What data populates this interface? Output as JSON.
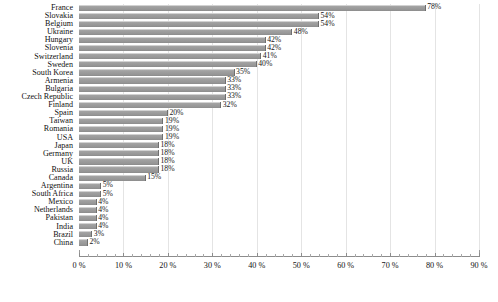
{
  "chart_data": {
    "type": "bar",
    "orientation": "horizontal",
    "title": "",
    "subtitle": "",
    "xlabel": "",
    "ylabel": "",
    "xlim": [
      0,
      90
    ],
    "grid": true,
    "legend": null,
    "value_suffix": "%",
    "tick_labels": [
      "0 %",
      "10 %",
      "20 %",
      "30 %",
      "40 %",
      "50 %",
      "60 %",
      "70 %",
      "80 %",
      "90 %"
    ],
    "tick_values": [
      0,
      10,
      20,
      30,
      40,
      50,
      60,
      70,
      80,
      90
    ],
    "bar_color": "#9b9b9b",
    "categories": [
      "France",
      "Slovakia",
      "Belgium",
      "Ukraine",
      "Hungary",
      "Slovenia",
      "Switzerland",
      "Sweden",
      "South Korea",
      "Armenia",
      "Bulgaria",
      "Czech Republic",
      "Finland",
      "Spain",
      "Taiwan",
      "Romania",
      "USA",
      "Japan",
      "Germany",
      "UK",
      "Russia",
      "Canada",
      "Argentina",
      "South Africa",
      "Mexico",
      "Netherlands",
      "Pakistan",
      "India",
      "Brazil",
      "China"
    ],
    "values": [
      78,
      54,
      54,
      48,
      42,
      42,
      41,
      40,
      35,
      33,
      33,
      33,
      32,
      20,
      19,
      19,
      19,
      18,
      18,
      18,
      18,
      15,
      5,
      5,
      4,
      4,
      4,
      4,
      3,
      2
    ],
    "data_labels": [
      "78%",
      "54%",
      "54%",
      "48%",
      "42%",
      "42%",
      "41%",
      "40%",
      "35%",
      "33%",
      "33%",
      "33%",
      "32%",
      "20%",
      "19%",
      "19%",
      "19%",
      "18%",
      "18%",
      "18%",
      "18%",
      "15%",
      "5%",
      "5%",
      "4%",
      "4%",
      "4%",
      "4%",
      "3%",
      "2%"
    ]
  }
}
